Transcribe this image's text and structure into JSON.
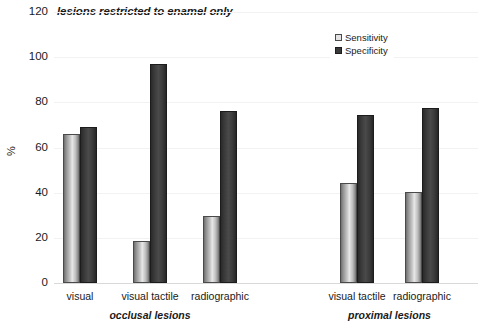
{
  "chart_data": {
    "type": "bar",
    "title": "lesions restricted to enamel only",
    "xlabel": "",
    "ylabel": "%",
    "ylim": [
      0,
      120
    ],
    "yticks": [
      0,
      20,
      40,
      60,
      80,
      100,
      120
    ],
    "grid": true,
    "legend_position": "top-right",
    "legend": [
      "Sensitivity",
      "Specificity"
    ],
    "categories": [
      "visual",
      "visual tactile",
      "radiographic",
      "visual tactile",
      "radiographic"
    ],
    "groups": [
      {
        "label": "occlusal lesions",
        "categories": [
          "visual",
          "visual tactile",
          "radiographic"
        ]
      },
      {
        "label": "proximal lesions",
        "categories": [
          "visual tactile",
          "radiographic"
        ]
      }
    ],
    "series": [
      {
        "name": "Sensitivity",
        "color": "#c8c8c8",
        "values": [
          66,
          18.5,
          29.5,
          44.5,
          40.5
        ]
      },
      {
        "name": "Specificity",
        "color": "#3a3a3a",
        "values": [
          69,
          97,
          76,
          74.5,
          77.5
        ]
      }
    ]
  },
  "axis": {
    "y_label": "%",
    "y_tick_labels": [
      "120",
      "100",
      "80",
      "60",
      "40",
      "20",
      "0"
    ]
  },
  "legend": {
    "items": [
      {
        "label": "Sensitivity",
        "swatch": "sensitivity-swatch"
      },
      {
        "label": "Specificity",
        "swatch": "specificity-swatch"
      }
    ]
  }
}
